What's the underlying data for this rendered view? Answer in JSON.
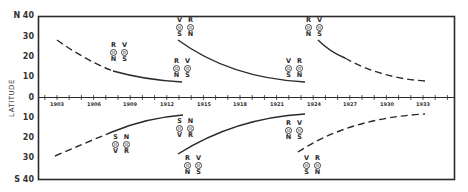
{
  "chart_data": {
    "type": "line",
    "title": "",
    "xlabel": "",
    "ylabel": "LATITUDE",
    "x_ticks": [
      "1903",
      "1906",
      "1909",
      "1912",
      "1915",
      "1918",
      "1921",
      "1924",
      "1927",
      "1930",
      "1933"
    ],
    "y_ticks": [
      "N 40",
      "30",
      "20",
      "10",
      "0",
      "10",
      "20",
      "30",
      "S 40"
    ],
    "xlim": [
      1901.5,
      1935.5
    ],
    "ylim": [
      -40,
      40
    ],
    "grid": false,
    "series": [
      {
        "name": "N cycle 1",
        "hemisphere": "N",
        "style": "dashed-then-solid",
        "points": [
          [
            1903,
            28
          ],
          [
            1905,
            22
          ],
          [
            1907.5,
            16
          ],
          [
            1909,
            13
          ],
          [
            1911,
            10
          ],
          [
            1913,
            8
          ]
        ]
      },
      {
        "name": "N cycle 2",
        "hemisphere": "N",
        "style": "solid",
        "points": [
          [
            1913,
            28
          ],
          [
            1915,
            22
          ],
          [
            1917,
            17
          ],
          [
            1919,
            13
          ],
          [
            1921,
            10
          ],
          [
            1923,
            8
          ]
        ]
      },
      {
        "name": "N cycle 3",
        "hemisphere": "N",
        "style": "solid-then-dashed",
        "points": [
          [
            1924,
            28
          ],
          [
            1926,
            22
          ],
          [
            1928,
            16
          ],
          [
            1930,
            12
          ],
          [
            1932,
            10
          ],
          [
            1933,
            9
          ]
        ]
      },
      {
        "name": "S cycle 1",
        "hemisphere": "S",
        "style": "dashed-then-solid",
        "points": [
          [
            1903,
            -28
          ],
          [
            1905,
            -23
          ],
          [
            1907.5,
            -17
          ],
          [
            1909,
            -14
          ],
          [
            1911,
            -11
          ],
          [
            1913,
            -9
          ]
        ]
      },
      {
        "name": "S cycle 2",
        "hemisphere": "S",
        "style": "solid",
        "points": [
          [
            1913,
            -27
          ],
          [
            1915,
            -22
          ],
          [
            1917,
            -17
          ],
          [
            1919,
            -13
          ],
          [
            1921,
            -11
          ],
          [
            1923,
            -8
          ]
        ]
      },
      {
        "name": "S cycle 3",
        "hemisphere": "S",
        "style": "dashed",
        "points": [
          [
            1923,
            -27
          ],
          [
            1925,
            -21
          ],
          [
            1927,
            -17
          ],
          [
            1929,
            -13
          ],
          [
            1931,
            -11
          ],
          [
            1933,
            -9
          ]
        ]
      }
    ],
    "annotations": [
      {
        "id": "n1-mid",
        "top": [
          "R",
          "V"
        ],
        "bottom": [
          "N",
          "S"
        ]
      },
      {
        "id": "n1-end",
        "top": [
          "R",
          "V"
        ],
        "bottom": [
          "N",
          "S"
        ]
      },
      {
        "id": "n2-start",
        "top": [
          "V",
          "R"
        ],
        "bottom": [
          "S",
          "N"
        ]
      },
      {
        "id": "n2-end",
        "top": [
          "V",
          "R"
        ],
        "bottom": [
          "S",
          "N"
        ]
      },
      {
        "id": "n3-start",
        "top": [
          "R",
          "V"
        ],
        "bottom": [
          "N",
          "S"
        ]
      },
      {
        "id": "s1-mid",
        "top": [
          "S",
          "N"
        ],
        "bottom": [
          "V",
          "R"
        ]
      },
      {
        "id": "s1-end",
        "top": [
          "S",
          "N"
        ],
        "bottom": [
          "V",
          "R"
        ]
      },
      {
        "id": "s2-start",
        "top": [
          "R",
          "V"
        ],
        "bottom": [
          "N",
          "S"
        ]
      },
      {
        "id": "s2-end",
        "top": [
          "R",
          "V"
        ],
        "bottom": [
          "N",
          "S"
        ]
      },
      {
        "id": "s3-start",
        "top": [
          "V",
          "R"
        ],
        "bottom": [
          "S",
          "N"
        ]
      }
    ]
  },
  "labels": {
    "axis_title": "LATITUDE",
    "y": [
      "N 40",
      "30",
      "20",
      "10",
      "0",
      "10",
      "20",
      "30",
      "S 40"
    ],
    "x": [
      "1903",
      "1906",
      "1909",
      "1912",
      "1915",
      "1918",
      "1921",
      "1924",
      "1927",
      "1930",
      "1933"
    ]
  },
  "groups": [
    {
      "top": [
        "R",
        "V"
      ],
      "bottom": [
        "N",
        "S"
      ]
    },
    {
      "top": [
        "R",
        "V"
      ],
      "bottom": [
        "N",
        "S"
      ]
    },
    {
      "top": [
        "V",
        "R"
      ],
      "bottom": [
        "S",
        "N"
      ]
    },
    {
      "top": [
        "V",
        "R"
      ],
      "bottom": [
        "S",
        "N"
      ]
    },
    {
      "top": [
        "R",
        "V"
      ],
      "bottom": [
        "N",
        "S"
      ]
    },
    {
      "top": [
        "S",
        "N"
      ],
      "bottom": [
        "V",
        "R"
      ]
    },
    {
      "top": [
        "S",
        "N"
      ],
      "bottom": [
        "V",
        "R"
      ]
    },
    {
      "top": [
        "R",
        "V"
      ],
      "bottom": [
        "N",
        "S"
      ]
    },
    {
      "top": [
        "R",
        "V"
      ],
      "bottom": [
        "N",
        "S"
      ]
    },
    {
      "top": [
        "V",
        "R"
      ],
      "bottom": [
        "S",
        "N"
      ]
    }
  ],
  "colors": {
    "ink": "#2a2a2a",
    "paper": "#ffffff"
  }
}
